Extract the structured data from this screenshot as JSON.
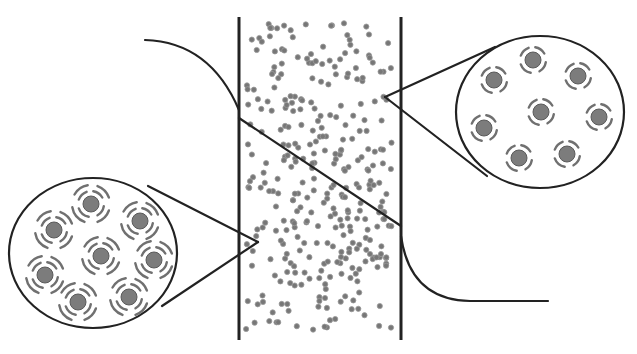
{
  "diagram": {
    "title": "",
    "colors": {
      "line": "#222222",
      "particle": "#777777",
      "core": "#7c7c7c",
      "shell": "#707070",
      "background": "#ffffff"
    },
    "column": {
      "left_x": 239,
      "right_x": 401,
      "top_y": 17,
      "bottom_y": 340,
      "particle_count": 330,
      "seed": 7
    },
    "left_curve": {
      "path": "M145,40 Q210,42 239,110"
    },
    "right_curve": {
      "path": "M401,236 Q410,300 470,301 L548,301"
    },
    "diagonal_line": {
      "x1": 239,
      "y1": 118,
      "x2": 401,
      "y2": 226
    },
    "magnifier_right": {
      "cx": 540,
      "cy": 112,
      "rx": 84,
      "ry": 76,
      "pointer_tip": [
        385,
        97
      ],
      "pointer_tangent_top": [
        495,
        47
      ],
      "pointer_tangent_bottom": [
        487,
        176
      ],
      "shell_style": "single",
      "particles": [
        [
          533,
          60
        ],
        [
          494,
          80
        ],
        [
          578,
          76
        ],
        [
          541,
          112
        ],
        [
          599,
          117
        ],
        [
          484,
          128
        ],
        [
          519,
          158
        ],
        [
          567,
          154
        ]
      ]
    },
    "magnifier_left": {
      "cx": 93,
      "cy": 253,
      "rx": 84,
      "ry": 75,
      "pointer_tip": [
        258,
        242
      ],
      "pointer_tangent_top": [
        148,
        186
      ],
      "pointer_tangent_bottom": [
        162,
        306
      ],
      "shell_style": "double",
      "particles": [
        [
          91,
          204
        ],
        [
          54,
          230
        ],
        [
          140,
          221
        ],
        [
          101,
          256
        ],
        [
          154,
          260
        ],
        [
          45,
          275
        ],
        [
          78,
          302
        ],
        [
          129,
          297
        ]
      ]
    }
  }
}
